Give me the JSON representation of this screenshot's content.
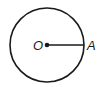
{
  "diagram": {
    "type": "circle-with-radius",
    "center_label": "O",
    "point_label": "A",
    "stroke_color": "#1a1a1a",
    "background": "#ffffff"
  }
}
